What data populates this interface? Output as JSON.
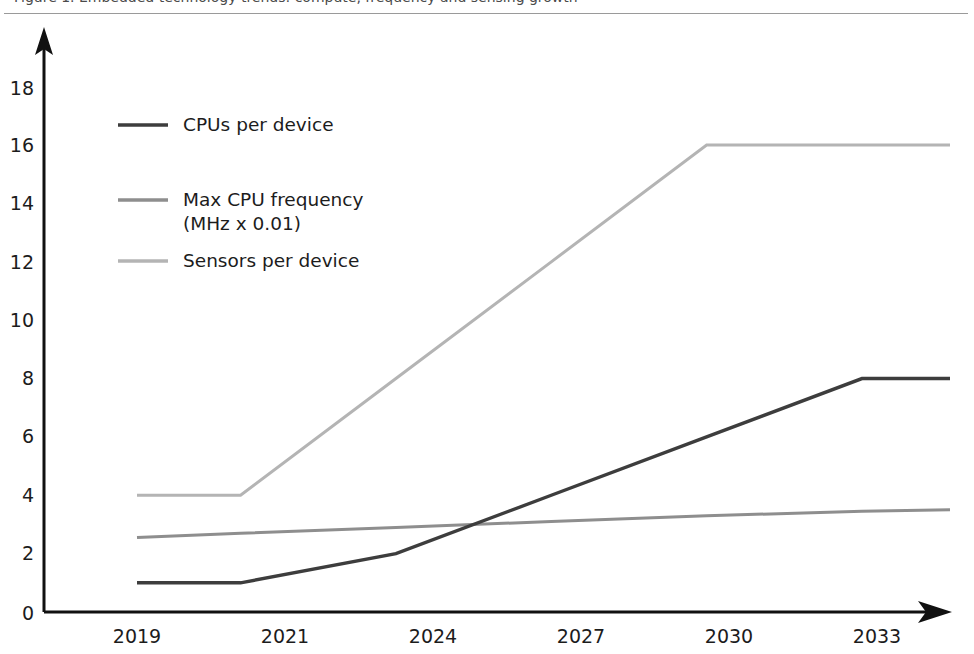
{
  "top_strip": {
    "heading_text": "Figure 1. Embedded technology trends: compute, frequency and sensing growth"
  },
  "chart_data": {
    "type": "line",
    "title": "",
    "xlabel": "",
    "ylabel": "",
    "x": [
      "2019",
      "2021",
      "2024",
      "2027",
      "2030",
      "2033"
    ],
    "categories": [
      "2019",
      "2021",
      "2024",
      "2027",
      "2030",
      "2033"
    ],
    "xlim": [
      2019,
      2034.7
    ],
    "ylim": [
      0,
      19.2
    ],
    "yticks": [
      "0",
      "2",
      "4",
      "6",
      "8",
      "10",
      "12",
      "14",
      "16",
      "18"
    ],
    "ytick_values": [
      0,
      2,
      4,
      6,
      8,
      10,
      12,
      14,
      16,
      18
    ],
    "grid": false,
    "legend_position": "upper-left-inside",
    "series": [
      {
        "name": "CPUs per device",
        "color": "#3d3d3d",
        "x": [
          2019,
          2021,
          2024,
          2027,
          2030,
          2033,
          2034.7
        ],
        "values": [
          1,
          1,
          2,
          4,
          6,
          8,
          8
        ]
      },
      {
        "name": "Max CPU frequency\n(MHz x 0.01)",
        "color": "#8e8e8e",
        "x": [
          2019,
          2021,
          2024,
          2027,
          2030,
          2033,
          2034.7
        ],
        "values": [
          2.55,
          2.7,
          2.9,
          3.1,
          3.3,
          3.45,
          3.5
        ]
      },
      {
        "name": "Sensors per device",
        "color": "#b4b4b4",
        "x": [
          2019,
          2021,
          2024,
          2027,
          2030,
          2033,
          2034.7
        ],
        "values": [
          4,
          4,
          8,
          12,
          16,
          16,
          16
        ]
      }
    ]
  },
  "legend": {
    "entries": [
      {
        "label": "CPUs per device",
        "label2": "",
        "color": "#3d3d3d"
      },
      {
        "label": "Max CPU frequency",
        "label2": "(MHz x 0.01)",
        "color": "#8e8e8e"
      },
      {
        "label": "Sensors per device",
        "label2": "",
        "color": "#b4b4b4"
      }
    ]
  },
  "axes": {
    "y_arrow": "arrow-up-icon",
    "x_arrow": "arrow-right-icon",
    "axis_color": "#111111"
  },
  "ytick_labels": [
    "18",
    "16",
    "14",
    "12",
    "10",
    "8",
    "6",
    "4",
    "2",
    "0"
  ],
  "xtick_labels": [
    "2019",
    "2021",
    "2024",
    "2027",
    "2030",
    "2033"
  ]
}
